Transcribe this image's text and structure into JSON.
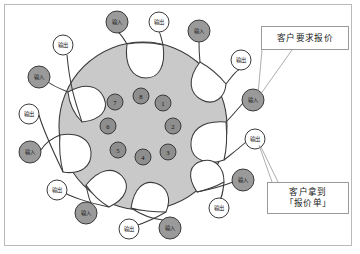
{
  "diagram": {
    "type": "circular-process-diagram",
    "title": "",
    "colors": {
      "core_fill": "#c9c9c9",
      "petal_fill": "#ffffff",
      "input_node_fill": "#9a9a9a",
      "output_node_fill": "#ffffff",
      "stage_node_fill": "#8e8e8e",
      "stroke": "#3a3a3a",
      "frame_border": "#b9b9b9",
      "callout_border": "#9a9a9a",
      "page_background": "#ffffff"
    },
    "core": {
      "center_x": 143,
      "center_y": 126,
      "radius": 84
    },
    "stage_nodes": [
      {
        "id": 1,
        "label": "1",
        "x": 163,
        "y": 103,
        "r": 8
      },
      {
        "id": 2,
        "label": "2",
        "x": 173,
        "y": 126,
        "r": 8
      },
      {
        "id": 3,
        "label": "3",
        "x": 168,
        "y": 152,
        "r": 8
      },
      {
        "id": 4,
        "label": "4",
        "x": 143,
        "y": 157,
        "r": 8
      },
      {
        "id": 5,
        "label": "5",
        "x": 118,
        "y": 150,
        "r": 8
      },
      {
        "id": 6,
        "label": "6",
        "x": 108,
        "y": 126,
        "r": 8
      },
      {
        "id": 7,
        "label": "7",
        "x": 115,
        "y": 102,
        "r": 8
      },
      {
        "id": 8,
        "label": "8",
        "x": 141,
        "y": 96,
        "r": 8
      }
    ],
    "perimeter_nodes": [
      {
        "id": "in-1",
        "kind": "input",
        "label": "输入",
        "x": 253,
        "y": 100,
        "r": 11
      },
      {
        "id": "out-1",
        "kind": "output",
        "label": "输出",
        "x": 241,
        "y": 60,
        "r": 10
      },
      {
        "id": "in-2",
        "kind": "input",
        "label": "输入",
        "x": 199,
        "y": 31,
        "r": 11
      },
      {
        "id": "out-2",
        "kind": "output",
        "label": "输出",
        "x": 159,
        "y": 22,
        "r": 10
      },
      {
        "id": "in-3",
        "kind": "input",
        "label": "输入",
        "x": 117,
        "y": 22,
        "r": 11
      },
      {
        "id": "out-3",
        "kind": "output",
        "label": "输出",
        "x": 63,
        "y": 45,
        "r": 10
      },
      {
        "id": "in-4",
        "kind": "input",
        "label": "输入",
        "x": 39,
        "y": 77,
        "r": 11
      },
      {
        "id": "out-4",
        "kind": "output",
        "label": "输出",
        "x": 29,
        "y": 114,
        "r": 10
      },
      {
        "id": "in-5",
        "kind": "input",
        "label": "输入",
        "x": 30,
        "y": 152,
        "r": 11
      },
      {
        "id": "out-5",
        "kind": "output",
        "label": "输出",
        "x": 57,
        "y": 190,
        "r": 10
      },
      {
        "id": "in-6",
        "kind": "input",
        "label": "输入",
        "x": 86,
        "y": 213,
        "r": 11
      },
      {
        "id": "out-6",
        "kind": "output",
        "label": "输出",
        "x": 129,
        "y": 229,
        "r": 10
      },
      {
        "id": "in-7",
        "kind": "input",
        "label": "输入",
        "x": 170,
        "y": 228,
        "r": 11
      },
      {
        "id": "out-7",
        "kind": "output",
        "label": "输出",
        "x": 219,
        "y": 208,
        "r": 10
      },
      {
        "id": "in-8",
        "kind": "input",
        "label": "输入",
        "x": 243,
        "y": 180,
        "r": 11
      },
      {
        "id": "out-8",
        "kind": "output",
        "label": "输出",
        "x": 255,
        "y": 139,
        "r": 10
      }
    ],
    "callouts": [
      {
        "id": "callout-top",
        "lines": [
          "客户要求报价"
        ],
        "points_to": "in-1"
      },
      {
        "id": "callout-bottom",
        "lines": [
          "客户拿到",
          "「报价单」"
        ],
        "points_to": "out-8"
      }
    ]
  }
}
